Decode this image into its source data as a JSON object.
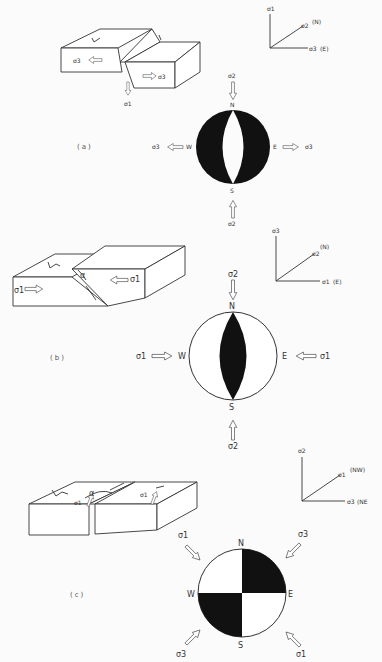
{
  "figure": {
    "panels": [
      {
        "id": "a",
        "caption": "(a)",
        "fault_type": "normal",
        "block_labels": {
          "left_stress": "σ3",
          "right_stress": "σ3",
          "down_stress": "σ1"
        },
        "axes": {
          "vertical": "σ1",
          "diagonal": "σ2",
          "diagonal_dir": "(N)",
          "horizontal": "σ3",
          "horizontal_dir": "(E)"
        },
        "beachball": {
          "N": "N",
          "S": "S",
          "E": "E",
          "W": "W",
          "top": "σ2",
          "bottom": "σ2",
          "left": "σ3",
          "right": "σ3",
          "pattern": "black with white central lens"
        }
      },
      {
        "id": "b",
        "caption": "(b)",
        "fault_type": "reverse",
        "block_labels": {
          "left_stress": "σ1",
          "right_stress": "σ1",
          "angle": "α"
        },
        "axes": {
          "vertical": "σ3",
          "diagonal": "σ2",
          "diagonal_dir": "(N)",
          "horizontal": "σ1",
          "horizontal_dir": "(E)"
        },
        "beachball": {
          "N": "N",
          "S": "S",
          "E": "E",
          "W": "W",
          "top": "σ2",
          "bottom": "σ2",
          "left": "σ1",
          "right": "σ1",
          "pattern": "white with black central lens"
        }
      },
      {
        "id": "c",
        "caption": "(c)",
        "fault_type": "strike-slip",
        "block_labels": {
          "left_stress": "σ1",
          "right_stress": "σ1",
          "angle": "α"
        },
        "axes": {
          "vertical": "σ2",
          "diagonal": "σ1",
          "diagonal_dir": "(NW)",
          "horizontal": "σ3",
          "horizontal_dir": "(NE"
        },
        "beachball": {
          "N": "N",
          "S": "S",
          "E": "E",
          "W": "W",
          "nw": "σ1",
          "ne": "σ3",
          "sw": "σ3",
          "se": "σ1",
          "pattern": "quadrants: NE and SW black"
        }
      }
    ]
  }
}
